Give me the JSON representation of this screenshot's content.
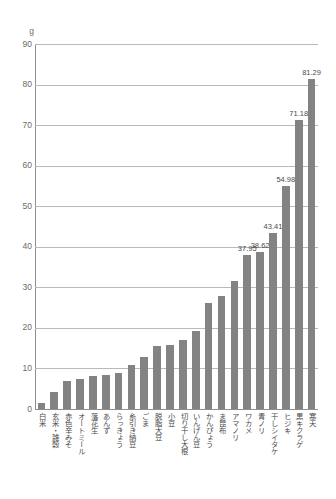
{
  "chart_data": {
    "type": "bar",
    "title": "",
    "xlabel": "",
    "ylabel": "g",
    "unit_label": "g",
    "ylim": [
      0,
      90
    ],
    "yticks": [
      0,
      10,
      20,
      30,
      40,
      50,
      60,
      70,
      80,
      90
    ],
    "ytick_labels": [
      "0",
      "10",
      "20",
      "30",
      "40",
      "50",
      "60",
      "70",
      "80",
      "90"
    ],
    "grid": true,
    "legend": false,
    "bar_color": "#838383",
    "categories": [
      "白米",
      "玄米・雑穀",
      "赤色辛みそ",
      "オートミール",
      "落花生",
      "あんず",
      "らっきょう",
      "糸引き納豆",
      "ごま",
      "脱脂大豆",
      "小豆",
      "切り干し大根",
      "いんげん豆",
      "かんぴょう",
      "ま昆布",
      "アマノリ",
      "ワカメ",
      "青ノリ",
      "干しシイタケ",
      "ヒジキ",
      "黒キクラゲ",
      "寒天"
    ],
    "values": [
      1.4,
      4.1,
      7.0,
      7.5,
      8.1,
      8.4,
      9.0,
      10.9,
      12.8,
      15.6,
      15.8,
      17.1,
      19.3,
      26.2,
      27.8,
      31.6,
      37.95,
      38.62,
      43.41,
      54.98,
      71.18,
      81.29
    ],
    "value_labels": [
      "",
      "",
      "",
      "",
      "",
      "",
      "",
      "",
      "",
      "",
      "",
      "",
      "",
      "",
      "",
      "",
      "37.95",
      "38.62",
      "43.41",
      "54.98",
      "71.18",
      "81.29"
    ]
  }
}
